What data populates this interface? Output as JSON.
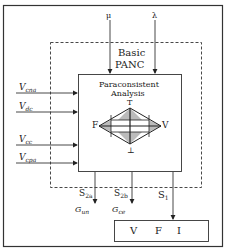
{
  "diagram": {
    "top_inputs": [
      {
        "label": "μ"
      },
      {
        "label": "λ"
      }
    ],
    "block_title": [
      "Basic",
      "PANC"
    ],
    "inner_title": [
      "Paraconsistent",
      "Analysis"
    ],
    "lattice": {
      "top": "T",
      "left": "F",
      "right": "V",
      "bottom": "⊥"
    },
    "left_inputs": [
      {
        "base": "V",
        "sub": "cna"
      },
      {
        "base": "V",
        "sub": "dc"
      },
      {
        "base": "V",
        "sub": "cc"
      },
      {
        "base": "V",
        "sub": "cpa"
      }
    ],
    "outputs": [
      {
        "base": "S",
        "sub": "2a"
      },
      {
        "base": "S",
        "sub": "2b"
      },
      {
        "base": "S",
        "sub": "1"
      }
    ],
    "output_targets": [
      {
        "base": "G",
        "sub": "un"
      },
      {
        "base": "G",
        "sub": "ce"
      }
    ],
    "result_box": [
      "V",
      "F",
      "I"
    ]
  }
}
